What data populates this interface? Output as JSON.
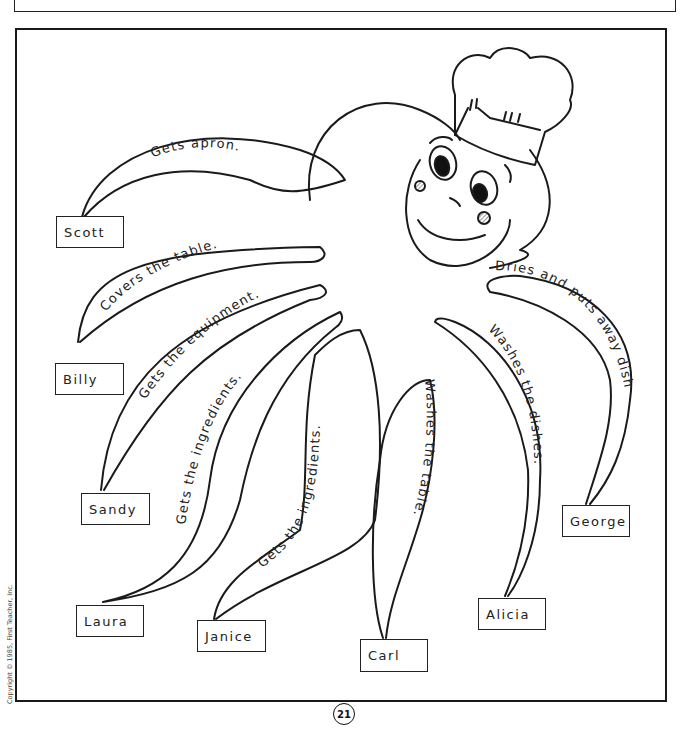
{
  "worksheet": {
    "page_number": "21",
    "copyright": "Copyright © 1985, First Teacher, Inc.",
    "character": "octopus-chef",
    "tentacles": [
      {
        "name": "Scott",
        "task": "Gets apron."
      },
      {
        "name": "Billy",
        "task": "Covers the table."
      },
      {
        "name": "Sandy",
        "task": "Gets the equipment."
      },
      {
        "name": "Laura",
        "task": "Gets the ingredients."
      },
      {
        "name": "Janice",
        "task": "Gets the ingredients."
      },
      {
        "name": "Carl",
        "task": "Washes the table."
      },
      {
        "name": "Alicia",
        "task": "Washes the dishes."
      },
      {
        "name": "George",
        "task": "Dries and puts away dishes."
      }
    ]
  },
  "colors": {
    "ink": "#1a1a1a",
    "paper": "#ffffff",
    "cheek_hatch": "#777777"
  }
}
